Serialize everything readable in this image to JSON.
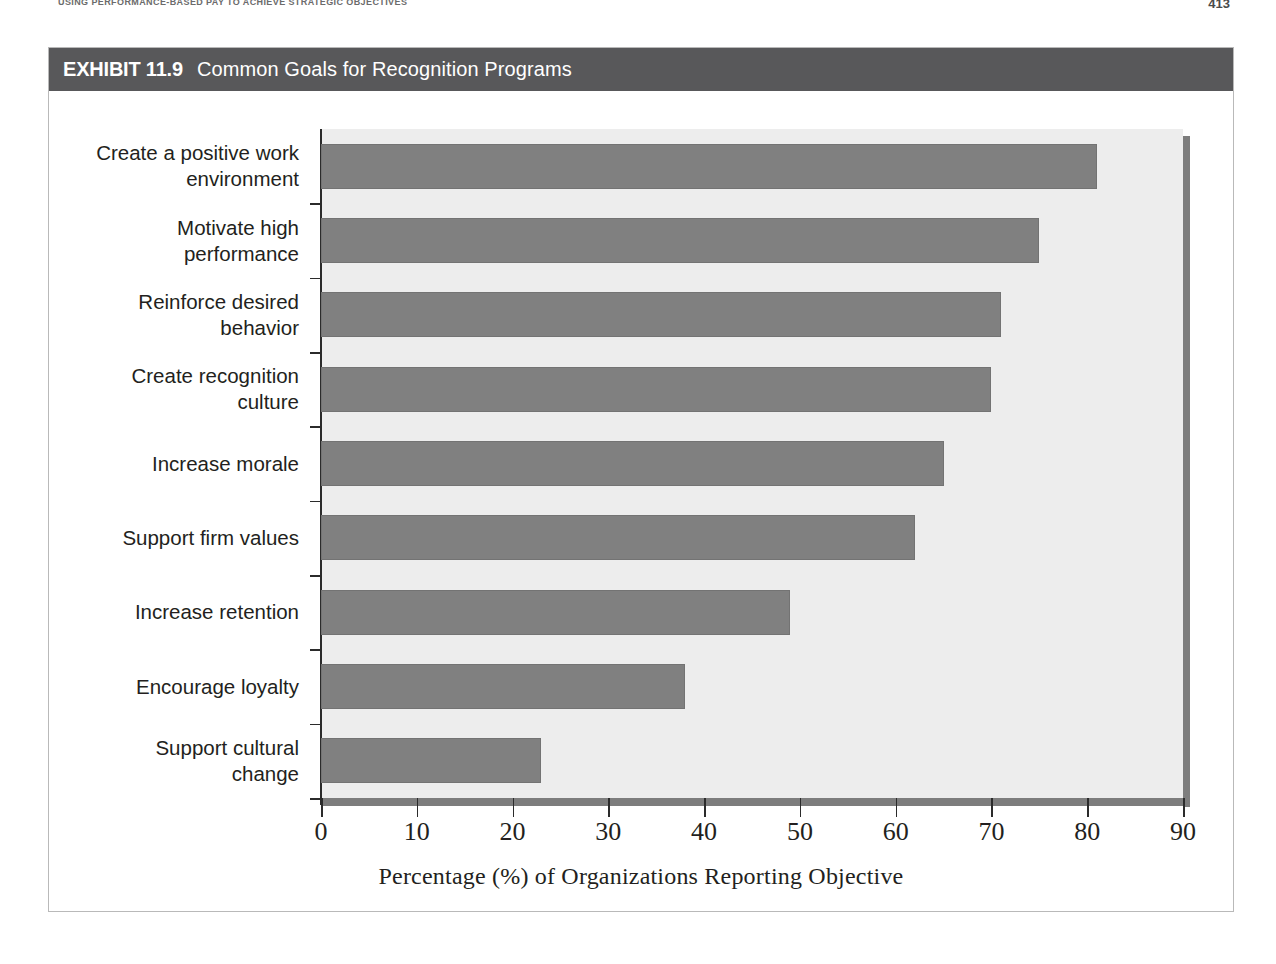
{
  "page": {
    "running_head": "USING PERFORMANCE-BASED PAY TO ACHIEVE STRATEGIC OBJECTIVES",
    "page_number": "413"
  },
  "exhibit": {
    "label": "EXHIBIT 11.9",
    "title": "Common Goals for Recognition Programs"
  },
  "colors": {
    "titlebar": "#58585a",
    "bar_fill": "#808080",
    "plot_background": "#ededed",
    "spine": "#7d7d7d",
    "text": "#231f20"
  },
  "chart_data": {
    "type": "bar",
    "orientation": "horizontal",
    "title": "Common Goals for Recognition Programs",
    "xlabel": "Percentage (%) of Organizations Reporting Objective",
    "ylabel": "",
    "xlim": [
      0,
      90
    ],
    "ylim": null,
    "grid": false,
    "legend": null,
    "xticks": [
      0,
      10,
      20,
      30,
      40,
      50,
      60,
      70,
      80,
      90
    ],
    "xticklabels": [
      "0",
      "10",
      "20",
      "30",
      "40",
      "50",
      "60",
      "70",
      "80",
      "90"
    ],
    "categories": [
      "Create a positive work environment",
      "Motivate high performance",
      "Reinforce desired behavior",
      "Create recognition culture",
      "Increase morale",
      "Support firm values",
      "Increase retention",
      "Encourage loyalty",
      "Support cultural change"
    ],
    "category_lines": [
      [
        "Create a positive work",
        "environment"
      ],
      [
        "Motivate high",
        "performance"
      ],
      [
        "Reinforce desired",
        "behavior"
      ],
      [
        "Create recognition",
        "culture"
      ],
      [
        "Increase morale"
      ],
      [
        "Support firm values"
      ],
      [
        "Increase retention"
      ],
      [
        "Encourage loyalty"
      ],
      [
        "Support cultural",
        "change"
      ]
    ],
    "values": [
      81,
      75,
      71,
      70,
      65,
      62,
      49,
      38,
      23
    ],
    "units": "percent"
  }
}
